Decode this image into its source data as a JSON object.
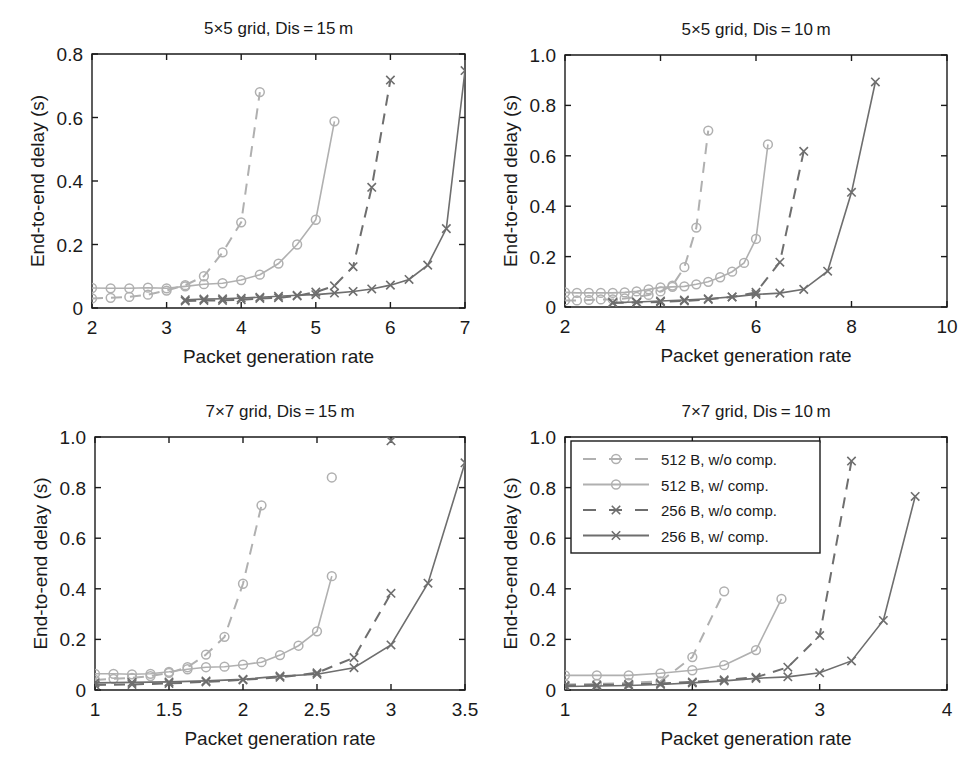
{
  "figure": {
    "background": "#ffffff",
    "width": 964,
    "height": 765,
    "axis_color": "#1a1a1a"
  },
  "series_styles": [
    {
      "key": "512_wo",
      "label": "512 B, w/o comp.",
      "color": "#b0b0b0",
      "dash": "dashed",
      "marker": "circle"
    },
    {
      "key": "512_w",
      "label": "512 B, w/ comp.",
      "color": "#b0b0b0",
      "dash": "solid",
      "marker": "circle"
    },
    {
      "key": "256_wo",
      "label": "256 B, w/o comp.",
      "color": "#6e6e6e",
      "dash": "dashed",
      "marker": "cross"
    },
    {
      "key": "256_w",
      "label": "256 B, w/ comp.",
      "color": "#6e6e6e",
      "dash": "solid",
      "marker": "cross"
    }
  ],
  "legend": {
    "position": "top-left-of-panel-4",
    "entries": [
      "512 B, w/o comp.",
      "512 B, w/ comp.",
      "256 B, w/o comp.",
      "256 B, w/ comp."
    ]
  },
  "chart_data": [
    {
      "type": "line",
      "panel": 1,
      "title": "5×5 grid, Dis = 15 m",
      "xlabel": "Packet generation rate",
      "ylabel": "End-to-end delay (s)",
      "xlim": [
        2,
        7
      ],
      "ylim": [
        0,
        0.8
      ],
      "xticks": [
        2,
        3,
        4,
        5,
        6,
        7
      ],
      "xticklabels": [
        "2",
        "3",
        "4",
        "5",
        "6",
        "7"
      ],
      "yticks": [
        0,
        0.2,
        0.4,
        0.6,
        0.8
      ],
      "yticklabels": [
        "0",
        "0.2",
        "0.4",
        "0.6",
        "0.8"
      ],
      "grid": false,
      "series": [
        {
          "name": "512 B, w/o comp.",
          "x": [
            2.0,
            2.25,
            2.5,
            2.75,
            3.0,
            3.25,
            3.5,
            3.75,
            4.0,
            4.25
          ],
          "y": [
            0.03,
            0.032,
            0.035,
            0.042,
            0.055,
            0.072,
            0.1,
            0.175,
            0.27,
            0.68
          ]
        },
        {
          "name": "512 B, w/ comp.",
          "x": [
            2.0,
            2.25,
            2.5,
            2.75,
            3.0,
            3.25,
            3.5,
            3.75,
            4.0,
            4.25,
            4.5,
            4.75,
            5.0,
            5.25
          ],
          "y": [
            0.063,
            0.062,
            0.062,
            0.064,
            0.062,
            0.068,
            0.075,
            0.078,
            0.088,
            0.105,
            0.14,
            0.2,
            0.278,
            0.588
          ]
        },
        {
          "name": "256 B, w/o comp.",
          "x": [
            3.25,
            3.5,
            3.75,
            4.0,
            4.25,
            4.5,
            4.75,
            5.0,
            5.25,
            5.5,
            5.75,
            6.0
          ],
          "y": [
            0.022,
            0.024,
            0.024,
            0.026,
            0.03,
            0.032,
            0.038,
            0.05,
            0.07,
            0.13,
            0.38,
            0.718
          ]
        },
        {
          "name": "256 B, w/ comp.",
          "x": [
            3.25,
            3.5,
            3.75,
            4.0,
            4.25,
            4.5,
            4.75,
            5.0,
            5.25,
            5.5,
            5.75,
            6.0,
            6.25,
            6.5,
            6.75,
            7.0
          ],
          "y": [
            0.026,
            0.028,
            0.029,
            0.031,
            0.034,
            0.037,
            0.04,
            0.042,
            0.047,
            0.052,
            0.06,
            0.072,
            0.09,
            0.135,
            0.25,
            0.748
          ]
        }
      ]
    },
    {
      "type": "line",
      "panel": 2,
      "title": "5×5 grid, Dis = 10 m",
      "xlabel": "Packet generation rate",
      "ylabel": "End-to-end delay (s)",
      "xlim": [
        2,
        10
      ],
      "ylim": [
        0,
        1.0
      ],
      "xticks": [
        2,
        4,
        6,
        8,
        10
      ],
      "xticklabels": [
        "2",
        "4",
        "6",
        "8",
        "10"
      ],
      "yticks": [
        0,
        0.2,
        0.4,
        0.6,
        0.8,
        1.0
      ],
      "yticklabels": [
        "0",
        "0.2",
        "0.4",
        "0.6",
        "0.8",
        "1.0"
      ],
      "grid": false,
      "series": [
        {
          "name": "512 B, w/o comp.",
          "x": [
            2.0,
            2.25,
            2.5,
            2.75,
            3.0,
            3.25,
            3.5,
            3.75,
            4.0,
            4.25,
            4.5,
            4.75,
            5.0
          ],
          "y": [
            0.026,
            0.026,
            0.028,
            0.03,
            0.03,
            0.034,
            0.04,
            0.048,
            0.062,
            0.085,
            0.158,
            0.315,
            0.7
          ]
        },
        {
          "name": "512 B, w/ comp.",
          "x": [
            2.0,
            2.25,
            2.5,
            2.75,
            3.0,
            3.25,
            3.5,
            3.75,
            4.0,
            4.25,
            4.5,
            4.75,
            5.0,
            5.25,
            5.5,
            5.75,
            6.0,
            6.25
          ],
          "y": [
            0.058,
            0.056,
            0.056,
            0.056,
            0.056,
            0.058,
            0.062,
            0.07,
            0.078,
            0.08,
            0.082,
            0.09,
            0.1,
            0.118,
            0.14,
            0.175,
            0.27,
            0.645
          ]
        },
        {
          "name": "256 B, w/o comp.",
          "x": [
            3.0,
            3.5,
            4.0,
            4.5,
            5.0,
            5.5,
            6.0,
            6.5,
            7.0
          ],
          "y": [
            0.016,
            0.018,
            0.02,
            0.024,
            0.03,
            0.04,
            0.058,
            0.178,
            0.618
          ]
        },
        {
          "name": "256 B, w/ comp.",
          "x": [
            3.0,
            3.5,
            4.0,
            4.5,
            5.0,
            5.5,
            6.0,
            6.5,
            7.0,
            7.5,
            8.0,
            8.5
          ],
          "y": [
            0.018,
            0.02,
            0.024,
            0.028,
            0.033,
            0.04,
            0.05,
            0.055,
            0.07,
            0.142,
            0.455,
            0.893
          ]
        }
      ]
    },
    {
      "type": "line",
      "panel": 3,
      "title": "7×7 grid, Dis = 15 m",
      "xlabel": "Packet generation rate",
      "ylabel": "End-to-end delay (s)",
      "xlim": [
        1,
        3.5
      ],
      "ylim": [
        0,
        1.0
      ],
      "xticks": [
        1,
        1.5,
        2,
        2.5,
        3,
        3.5
      ],
      "xticklabels": [
        "1",
        "1.5",
        "2",
        "2.5",
        "3",
        "3.5"
      ],
      "yticks": [
        0,
        0.2,
        0.4,
        0.6,
        0.8,
        1.0
      ],
      "yticklabels": [
        "0",
        "0.2",
        "0.4",
        "0.6",
        "0.8",
        "1.0"
      ],
      "grid": false,
      "series": [
        {
          "name": "512 B, w/o comp.",
          "x": [
            1.0,
            1.125,
            1.25,
            1.375,
            1.5,
            1.625,
            1.75,
            1.875,
            2.0,
            2.125
          ],
          "y": [
            0.04,
            0.044,
            0.048,
            0.055,
            0.068,
            0.09,
            0.14,
            0.21,
            0.42,
            0.73
          ]
        },
        {
          "name": "512 B, w/ comp.",
          "x": [
            1.0,
            1.125,
            1.25,
            1.375,
            1.5,
            1.625,
            1.75,
            1.875,
            2.0,
            2.125,
            2.25,
            2.375,
            2.5,
            2.6
          ],
          "y": [
            0.064,
            0.064,
            0.062,
            0.064,
            0.072,
            0.082,
            0.09,
            0.092,
            0.1,
            0.11,
            0.138,
            0.175,
            0.232,
            0.45
          ]
        },
        {
          "name": "256 B, w/o comp.",
          "x": [
            1.0,
            1.25,
            1.5,
            1.75,
            2.0,
            2.25,
            2.5,
            2.75,
            3.0
          ],
          "y": [
            0.02,
            0.022,
            0.026,
            0.032,
            0.04,
            0.05,
            0.068,
            0.128,
            0.382
          ]
        },
        {
          "name": "256 B, w/ comp.",
          "x": [
            1.0,
            1.25,
            1.5,
            1.75,
            2.0,
            2.25,
            2.5,
            2.75,
            3.0,
            3.25,
            3.5
          ],
          "y": [
            0.028,
            0.03,
            0.032,
            0.036,
            0.042,
            0.055,
            0.062,
            0.088,
            0.178,
            0.422,
            0.898
          ]
        }
      ],
      "extra_points": [
        {
          "name": "512 B, w/ comp.",
          "x": 2.6,
          "y": 0.84
        },
        {
          "name": "256 B, w/o comp.",
          "x": 3.0,
          "y": 0.985
        }
      ]
    },
    {
      "type": "line",
      "panel": 4,
      "title": "7×7 grid, Dis = 10 m",
      "xlabel": "Packet generation rate",
      "ylabel": "End-to-end delay (s)",
      "xlim": [
        1,
        4
      ],
      "ylim": [
        0,
        1.0
      ],
      "xticks": [
        1,
        2,
        3,
        4
      ],
      "xticklabels": [
        "1",
        "2",
        "3",
        "4"
      ],
      "yticks": [
        0,
        0.2,
        0.4,
        0.6,
        0.8,
        1.0
      ],
      "yticklabels": [
        "0",
        "0.2",
        "0.4",
        "0.6",
        "0.8",
        "1.0"
      ],
      "grid": false,
      "series": [
        {
          "name": "512 B, w/o comp.",
          "x": [
            1.0,
            1.25,
            1.5,
            1.75,
            2.0,
            2.25
          ],
          "y": [
            0.022,
            0.024,
            0.028,
            0.034,
            0.13,
            0.39
          ]
        },
        {
          "name": "512 B, w/ comp.",
          "x": [
            1.0,
            1.25,
            1.5,
            1.75,
            2.0,
            2.25,
            2.5,
            2.7
          ],
          "y": [
            0.058,
            0.058,
            0.058,
            0.066,
            0.078,
            0.098,
            0.158,
            0.36
          ]
        },
        {
          "name": "256 B, w/o comp.",
          "x": [
            1.0,
            1.25,
            1.5,
            1.75,
            2.0,
            2.25,
            2.5,
            2.75,
            3.0,
            3.25
          ],
          "y": [
            0.018,
            0.02,
            0.022,
            0.026,
            0.032,
            0.04,
            0.05,
            0.09,
            0.215,
            0.905
          ]
        },
        {
          "name": "256 B, w/ comp.",
          "x": [
            1.0,
            1.25,
            1.5,
            1.75,
            2.0,
            2.25,
            2.5,
            2.75,
            3.0,
            3.25,
            3.5,
            3.75
          ],
          "y": [
            0.014,
            0.016,
            0.018,
            0.022,
            0.028,
            0.036,
            0.046,
            0.052,
            0.068,
            0.115,
            0.275,
            0.765
          ]
        }
      ]
    }
  ]
}
